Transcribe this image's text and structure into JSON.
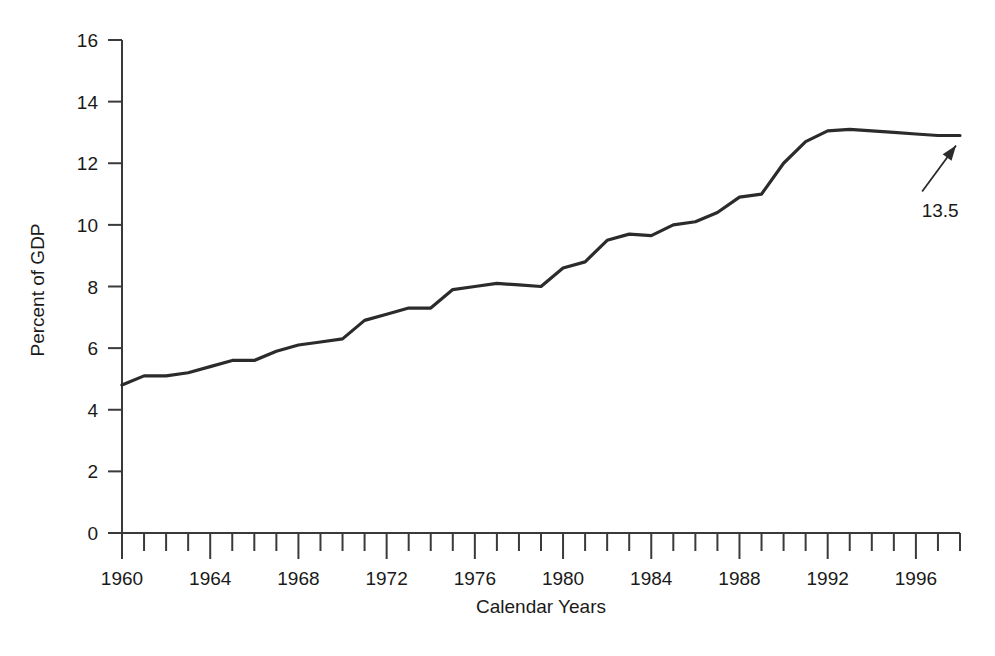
{
  "chart_data": {
    "type": "line",
    "title": "",
    "xlabel": "Calendar Years",
    "ylabel": "Percent of GDP",
    "xlim": [
      1960,
      1998
    ],
    "ylim": [
      0,
      16
    ],
    "grid": false,
    "legend": null,
    "y_ticks": [
      0,
      2,
      4,
      6,
      8,
      10,
      12,
      14,
      16
    ],
    "y_tick_labels": [
      "0",
      "2",
      "4",
      "6",
      "8",
      "10",
      "12",
      "14",
      "16"
    ],
    "x_ticks_major": [
      1960,
      1964,
      1968,
      1972,
      1976,
      1980,
      1984,
      1988,
      1992,
      1996
    ],
    "x_tick_labels": [
      "1960",
      "1964",
      "1968",
      "1972",
      "1976",
      "1980",
      "1984",
      "1988",
      "1992",
      "1996"
    ],
    "x_ticks_minor_step": 1,
    "x": [
      1960,
      1961,
      1962,
      1963,
      1964,
      1965,
      1966,
      1967,
      1968,
      1969,
      1970,
      1971,
      1972,
      1973,
      1974,
      1975,
      1976,
      1977,
      1978,
      1979,
      1980,
      1981,
      1982,
      1983,
      1984,
      1985,
      1986,
      1987,
      1988,
      1989,
      1990,
      1991,
      1992,
      1993,
      1994,
      1995,
      1996,
      1997,
      1998
    ],
    "values": [
      4.8,
      5.1,
      5.1,
      5.2,
      5.4,
      5.6,
      5.6,
      5.9,
      6.1,
      6.2,
      6.3,
      6.9,
      7.1,
      7.3,
      7.3,
      7.9,
      8.0,
      8.1,
      8.05,
      8.0,
      8.6,
      8.8,
      9.5,
      9.7,
      9.65,
      10.0,
      10.1,
      10.4,
      10.9,
      11.0,
      12.0,
      12.7,
      13.05,
      13.1,
      13.05,
      13.0,
      12.95,
      12.9,
      12.9
    ],
    "series_name": "Health expenditures as percent of GDP",
    "annotations": [
      {
        "text": "13.5",
        "x": 1997.1,
        "y": 10.5,
        "points_to_x": 1998.0,
        "points_to_y": 12.9
      }
    ]
  },
  "axis": {
    "y_title": "Percent of GDP",
    "x_title": "Calendar Years"
  },
  "annotation": {
    "value_label": "13.5"
  },
  "colors": {
    "line": "#2b2b2b",
    "axis": "#3a3a3a",
    "text": "#1a1a1a",
    "background": "#ffffff"
  }
}
